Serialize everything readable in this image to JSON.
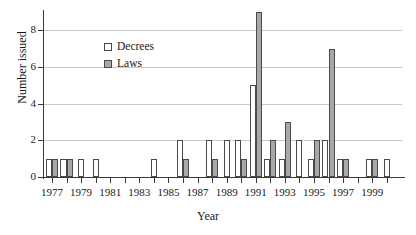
{
  "chart_data": {
    "type": "bar",
    "title": "",
    "xlabel": "Year",
    "ylabel": "Number issued",
    "ylim": [
      0,
      9
    ],
    "yticks": [
      0,
      2,
      4,
      6,
      8
    ],
    "ytick_labels": [
      "0",
      "2",
      "4",
      "6",
      "8"
    ],
    "grid": true,
    "legend_position": "upper-left-inside",
    "x": [
      1977,
      1978,
      1979,
      1980,
      1981,
      1982,
      1983,
      1984,
      1985,
      1986,
      1987,
      1988,
      1989,
      1990,
      1991,
      1992,
      1993,
      1994,
      1995,
      1996,
      1997,
      1998,
      1999,
      2000
    ],
    "xtick_labels": [
      "1977",
      "1979",
      "1981",
      "1983",
      "1985",
      "1987",
      "1989",
      "1991",
      "1993",
      "1995",
      "1997",
      "1999"
    ],
    "xtick_values": [
      1977,
      1979,
      1981,
      1983,
      1985,
      1987,
      1989,
      1991,
      1993,
      1995,
      1997,
      1999
    ],
    "series": [
      {
        "name": "Decrees",
        "color": "#ffffff",
        "values": [
          1,
          1,
          1,
          1,
          0,
          0,
          0,
          1,
          0,
          2,
          0,
          2,
          2,
          2,
          5,
          1,
          1,
          2,
          1,
          2,
          1,
          0,
          1,
          1
        ]
      },
      {
        "name": "Laws",
        "color": "#a8a8a8",
        "values": [
          1,
          1,
          0,
          0,
          0,
          0,
          0,
          0,
          0,
          1,
          0,
          1,
          0,
          1,
          9,
          2,
          3,
          0,
          2,
          7,
          1,
          0,
          1,
          0
        ]
      }
    ]
  },
  "legend": {
    "items": [
      {
        "label": "Decrees",
        "swatch": "white-square-swatch"
      },
      {
        "label": "Laws",
        "swatch": "gray-square-swatch"
      }
    ]
  },
  "axes": {
    "y_title": "Number issued",
    "x_title": "Year"
  }
}
